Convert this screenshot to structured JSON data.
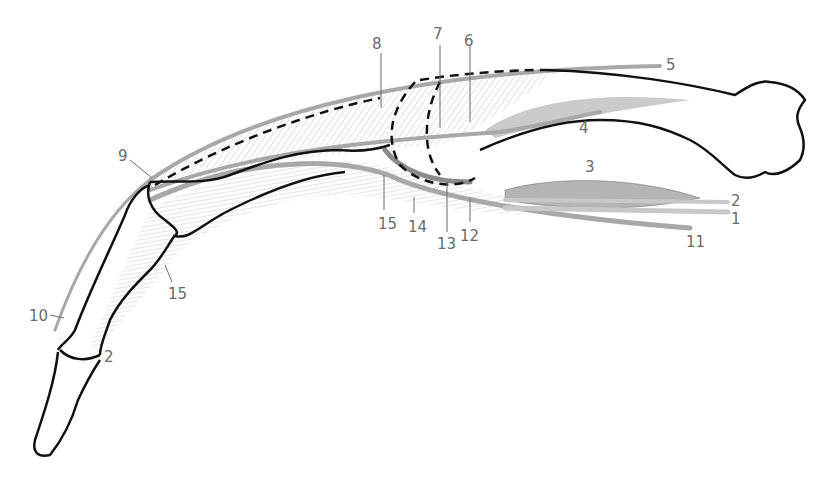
{
  "diagram": {
    "colors": {
      "bone_outline": "#111111",
      "tendon": "#a8a8a8",
      "hatching": "#b5b5b5",
      "muscle": "#555555",
      "label": "#6a6a6a"
    },
    "labels": [
      {
        "id": "1",
        "text": "1",
        "x": 731,
        "y": 212
      },
      {
        "id": "2a",
        "text": "2",
        "x": 731,
        "y": 194
      },
      {
        "id": "2b",
        "text": "2",
        "x": 104,
        "y": 350
      },
      {
        "id": "3",
        "text": "3",
        "x": 585,
        "y": 160
      },
      {
        "id": "4",
        "text": "4",
        "x": 579,
        "y": 121
      },
      {
        "id": "5",
        "text": "5",
        "x": 666,
        "y": 58
      },
      {
        "id": "6",
        "text": "6",
        "x": 464,
        "y": 34
      },
      {
        "id": "7",
        "text": "7",
        "x": 433,
        "y": 27
      },
      {
        "id": "8",
        "text": "8",
        "x": 372,
        "y": 37
      },
      {
        "id": "9",
        "text": "9",
        "x": 118,
        "y": 149
      },
      {
        "id": "10",
        "text": "10",
        "x": 29,
        "y": 309
      },
      {
        "id": "11",
        "text": "11",
        "x": 686,
        "y": 235
      },
      {
        "id": "12",
        "text": "12",
        "x": 460,
        "y": 229
      },
      {
        "id": "13",
        "text": "13",
        "x": 437,
        "y": 237
      },
      {
        "id": "14",
        "text": "14",
        "x": 408,
        "y": 220
      },
      {
        "id": "15a",
        "text": "15",
        "x": 378,
        "y": 217
      },
      {
        "id": "15b",
        "text": "15",
        "x": 168,
        "y": 287
      }
    ]
  }
}
